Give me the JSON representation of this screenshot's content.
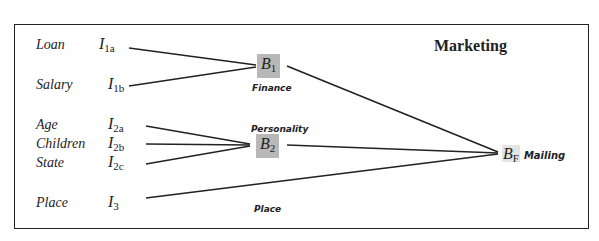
{
  "diagram": {
    "title": "Marketing",
    "inputs": [
      {
        "label": "Loan",
        "indicator": "I",
        "sub": "1a"
      },
      {
        "label": "Salary",
        "indicator": "I",
        "sub": "1b"
      },
      {
        "label": "Age",
        "indicator": "I",
        "sub": "2a"
      },
      {
        "label": "Children",
        "indicator": "I",
        "sub": "2b"
      },
      {
        "label": "State",
        "indicator": "I",
        "sub": "2c"
      },
      {
        "label": "Place",
        "indicator": "I",
        "sub": "3"
      }
    ],
    "intermediate_nodes": [
      {
        "symbol": "B",
        "sub": "1",
        "caption": "Finance"
      },
      {
        "symbol": "B",
        "sub": "2",
        "caption": "Personality"
      }
    ],
    "place_caption": "Place",
    "final_node": {
      "symbol": "B",
      "sub": "F",
      "caption": "Mailing"
    },
    "edges": [
      [
        "I1a",
        "B1"
      ],
      [
        "I1b",
        "B1"
      ],
      [
        "I2a",
        "B2"
      ],
      [
        "I2b",
        "B2"
      ],
      [
        "I2c",
        "B2"
      ],
      [
        "I3",
        "BF"
      ],
      [
        "B1",
        "BF"
      ],
      [
        "B2",
        "BF"
      ]
    ],
    "colors": {
      "node_fill": "#b8b8b8",
      "line": "#222222"
    }
  }
}
